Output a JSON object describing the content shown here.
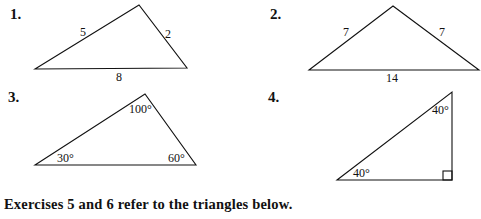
{
  "exercises": [
    {
      "number": "1.",
      "type": "side-lengths",
      "labels": {
        "left_side": "5",
        "right_side": "2",
        "base": "8"
      }
    },
    {
      "number": "2.",
      "type": "side-lengths",
      "labels": {
        "left_side": "7",
        "right_side": "7",
        "base": "14"
      }
    },
    {
      "number": "3.",
      "type": "angles",
      "labels": {
        "top": "100°",
        "left": "30°",
        "right": "60°"
      }
    },
    {
      "number": "4.",
      "type": "angles",
      "labels": {
        "top": "40°",
        "left": "40°",
        "right_angle_marker": true
      }
    }
  ],
  "caption": "Exercises 5 and 6 refer to the triangles below."
}
